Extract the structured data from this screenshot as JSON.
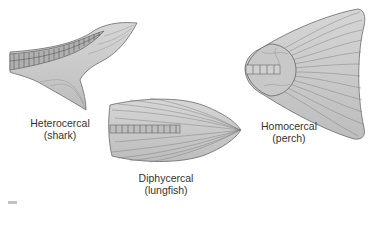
{
  "figure": {
    "tails": [
      {
        "id": "heterocercal",
        "name": "Heterocercal",
        "example": "(shark)"
      },
      {
        "id": "diphycercal",
        "name": "Diphycercal",
        "example": "(lungfish)"
      },
      {
        "id": "homocercal",
        "name": "Homocercal",
        "example": "(perch)"
      }
    ],
    "colors": {
      "fin_fill": "#c4c4c4",
      "fin_ray": "#7a7a7a",
      "outline": "#6a6a6a",
      "label_text": "#333333",
      "background": "#ffffff"
    }
  }
}
